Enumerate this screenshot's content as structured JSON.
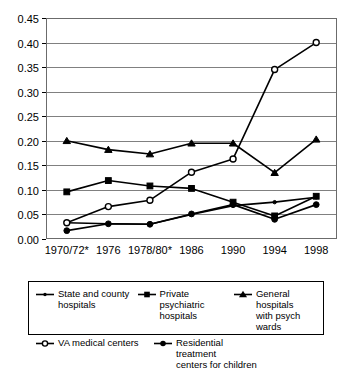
{
  "chart_data": {
    "type": "line",
    "title": "",
    "subtitle": "",
    "xlabel": "",
    "ylabel": "",
    "xlim_categories": [
      "1970/72*",
      "1976",
      "1978/80*",
      "1986",
      "1990",
      "1994",
      "1998"
    ],
    "ylim": [
      0.0,
      0.45
    ],
    "ytick_step": 0.05,
    "ytick_labels": [
      "0.00",
      "0.05",
      "0.10",
      "0.15",
      "0.20",
      "0.25",
      "0.30",
      "0.35",
      "0.40",
      "0.45"
    ],
    "ytick_values": [
      0.0,
      0.05,
      0.1,
      0.15,
      0.2,
      0.25,
      0.3,
      0.35,
      0.4,
      0.45
    ],
    "grid": "horizontal",
    "legend_position": "bottom",
    "categories": [
      "1970/72*",
      "1976",
      "1978/80*",
      "1986",
      "1990",
      "1994",
      "1998"
    ],
    "series": [
      {
        "name": "State and county hospitals",
        "marker": "dot",
        "values": [
          0.033,
          0.031,
          0.03,
          0.05,
          0.068,
          0.075,
          0.085
        ]
      },
      {
        "name": "Private psychiatric hospitals",
        "marker": "square",
        "values": [
          0.096,
          0.119,
          0.108,
          0.103,
          0.075,
          0.047,
          0.087
        ]
      },
      {
        "name": "General hospitals with psych wards",
        "marker": "triangle",
        "values": [
          0.2,
          0.182,
          0.173,
          0.195,
          0.195,
          0.135,
          0.203
        ]
      },
      {
        "name": "VA medical centers",
        "marker": "open-circle",
        "values": [
          0.033,
          0.066,
          0.079,
          0.136,
          0.163,
          0.345,
          0.4
        ]
      },
      {
        "name": "Residential treatment centers for children",
        "marker": "circle",
        "values": [
          0.017,
          0.031,
          0.03,
          0.051,
          0.07,
          0.04,
          0.07
        ]
      }
    ]
  },
  "legend": {
    "items": [
      {
        "label_line1": "State and county",
        "label_line2": "hospitals",
        "marker": "dot"
      },
      {
        "label_line1": "Private psychiatric",
        "label_line2": "hospitals",
        "marker": "square"
      },
      {
        "label_line1": "General hospitals",
        "label_line2": "with psych wards",
        "marker": "triangle"
      },
      {
        "label_line1": "VA medical centers",
        "label_line2": "",
        "marker": "open-circle"
      },
      {
        "label_line1": "Residential treatment",
        "label_line2": "centers for children",
        "marker": "circle"
      }
    ]
  },
  "colors": {
    "line": "#000000",
    "grid": "#808080",
    "frame": "#6b6b6b",
    "background": "#ffffff"
  }
}
